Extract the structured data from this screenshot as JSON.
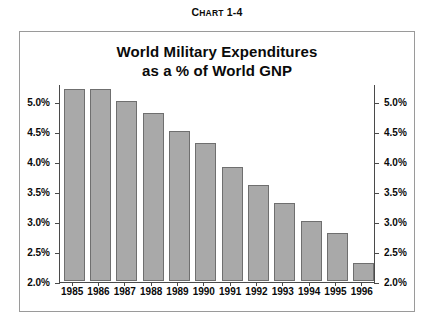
{
  "caption": {
    "prefix": "C",
    "small_caps": "HART",
    "number": " 1-4",
    "full": "CHART 1-4"
  },
  "figure": {
    "title_line1": "World Military Expenditures",
    "title_line2": "as a % of World GNP"
  },
  "colors": {
    "bar_fill": "#a9a9a9",
    "bar_stroke": "#6f6f6f",
    "axis": "#4a4a4a",
    "frame": "#9a9a9a",
    "text": "#0a0a0a",
    "background": "#ffffff"
  },
  "chart_data": {
    "type": "bar",
    "title": "World Military Expenditures as a % of World GNP",
    "subtitle": "",
    "xlabel": "",
    "ylabel": "",
    "categories": [
      "1985",
      "1986",
      "1987",
      "1988",
      "1989",
      "1990",
      "1991",
      "1992",
      "1993",
      "1994",
      "1995",
      "1996"
    ],
    "values": [
      5.2,
      5.2,
      5.0,
      4.8,
      4.5,
      4.3,
      3.9,
      3.6,
      3.3,
      3.0,
      2.8,
      2.3
    ],
    "ylim": [
      2.0,
      5.3
    ],
    "ytick_values": [
      2.0,
      2.5,
      3.0,
      3.5,
      4.0,
      4.5,
      5.0
    ],
    "ytick_labels": [
      "2.0%",
      "2.5%",
      "3.0%",
      "3.5%",
      "4.0%",
      "4.5%",
      "5.0%"
    ],
    "y_axis_duplicated_right": true,
    "grid": false,
    "legend": null,
    "value_unit": "percent"
  }
}
